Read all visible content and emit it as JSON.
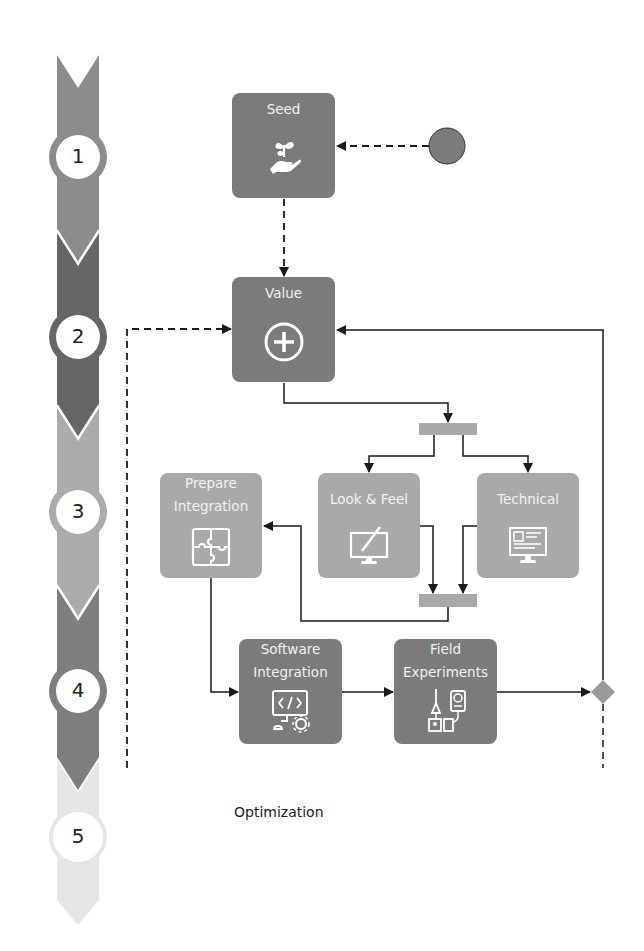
{
  "diagram": {
    "type": "process-flow",
    "steps": [
      {
        "number": "1"
      },
      {
        "number": "2"
      },
      {
        "number": "3"
      },
      {
        "number": "4"
      },
      {
        "number": "5"
      }
    ],
    "nodes": {
      "seed": {
        "label": "Seed",
        "icon": "hand-sprout-icon"
      },
      "value": {
        "label": "Value",
        "icon": "plus-circle-icon"
      },
      "prepare_integration": {
        "label": "Prepare Integration",
        "line1": "Prepare",
        "line2": "Integration",
        "icon": "puzzle-icon"
      },
      "look_feel": {
        "label": "Look & Feel",
        "icon": "monitor-pen-icon"
      },
      "technical": {
        "label": "Technical",
        "icon": "monitor-document-icon"
      },
      "software_integration": {
        "label": "Software Integration",
        "line1": "Software",
        "line2": "Integration",
        "icon": "monitor-code-gear-icon"
      },
      "field_experiments": {
        "label": "Field Experiments",
        "line1": "Field",
        "line2": "Experiments",
        "icon": "lab-equipment-icon"
      },
      "optimization": {
        "label": "Optimization"
      }
    },
    "colors": {
      "dark_box": "#7b7b7b",
      "light_box": "#a9a9a9",
      "connector": "#1a1a1a",
      "ribbon_1": "#8c8c8c",
      "ribbon_2": "#666666",
      "ribbon_3": "#ababab",
      "ribbon_4": "#7e7e7e",
      "ribbon_5": "#e4e4e4"
    }
  }
}
